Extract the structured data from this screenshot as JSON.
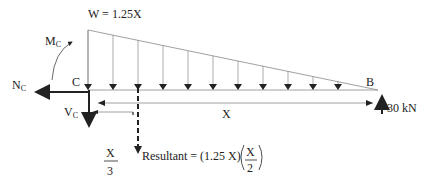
{
  "diagram": {
    "load_label": "W = 1.25X",
    "moment_label": "M",
    "moment_sub": "C",
    "normal_label": "N",
    "normal_sub": "C",
    "point_c": "C",
    "point_b": "B",
    "shear_label": "V",
    "shear_sub": "C",
    "length_label": "X",
    "reaction_label": "30 kN",
    "centroid_num": "X",
    "centroid_den": "3",
    "resultant_prefix": "Resultant = (1.25 X)",
    "resultant_num": "X",
    "resultant_den": "2",
    "colors": {
      "line": "#222222",
      "thin": "#888888"
    }
  }
}
